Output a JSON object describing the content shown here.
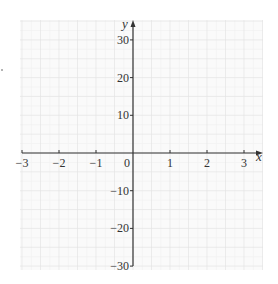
{
  "chart_data": {
    "type": "line",
    "title": "",
    "xlabel": "x",
    "ylabel": "y",
    "xlim": [
      -3,
      3
    ],
    "ylim": [
      -30,
      30
    ],
    "x_ticks": [
      -3,
      -2,
      -1,
      0,
      1,
      2,
      3
    ],
    "x_tick_labels": [
      "−3",
      "−2",
      "−1",
      "0",
      "1",
      "2",
      "3"
    ],
    "y_ticks": [
      30,
      20,
      10,
      -10,
      -20,
      -30
    ],
    "y_tick_labels": [
      "30",
      "20",
      "10",
      "−10",
      "−20",
      "−30"
    ],
    "grid": true,
    "grid_minor_step_x": 0.5,
    "grid_minor_step_y": 5,
    "series": [],
    "legend": null,
    "note": "Empty coordinate plane with grid; no data plotted"
  },
  "colors": {
    "axis": "#333333",
    "grid_major": "#e4e4e4",
    "grid_minor": "#f0f0f0",
    "background": "#ffffff",
    "grid_background": "#fafafa"
  },
  "labels": {
    "x_axis": "x",
    "y_axis": "y",
    "origin": "0"
  }
}
